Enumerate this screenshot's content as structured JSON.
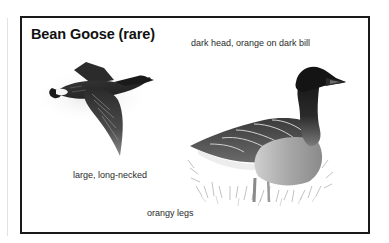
{
  "plate": {
    "title": "Bean Goose (rare)",
    "annotations": {
      "head": "dark head, orange on dark bill",
      "size": "large, long-necked",
      "legs": "orangy legs"
    },
    "illustrations": [
      {
        "name": "bean-goose-flying",
        "pose": "in flight"
      },
      {
        "name": "bean-goose-standing",
        "pose": "standing in grass"
      }
    ]
  },
  "colors": {
    "frame": "#1a1a1a",
    "background": "#ffffff",
    "bird_dark": "#1c1c1c",
    "bird_mid": "#6e6e6e",
    "bird_light": "#bdbdbd"
  }
}
